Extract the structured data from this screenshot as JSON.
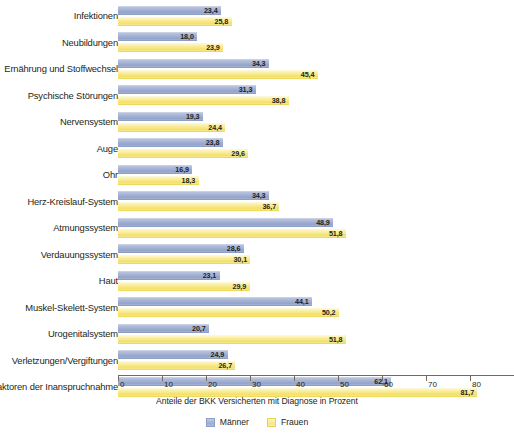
{
  "chart_data": {
    "type": "bar",
    "orientation": "horizontal",
    "title": "",
    "xlabel": "Anteile der BKK Versicherten mit Diagnose in Prozent",
    "ylabel": "",
    "xlim": [
      0,
      90
    ],
    "xticks": [
      0,
      10,
      20,
      30,
      40,
      50,
      60,
      70,
      80,
      90
    ],
    "grid": false,
    "legend_position": "bottom-center",
    "categories": [
      "Infektionen",
      "Neubildungen",
      "Ernährung und Stoffwechsel",
      "Psychische Störungen",
      "Nervensystem",
      "Auge",
      "Ohr",
      "Herz-Kreislauf-System",
      "Atmungssystem",
      "Verdauungssystem",
      "Haut",
      "Muskel-Skelett-System",
      "Urogenitalsystem",
      "Verletzungen/Vergiftungen",
      "Faktoren der Inanspruchnahme"
    ],
    "series": [
      {
        "name": "Männer",
        "color": "#a3b0d3",
        "values": [
          23.4,
          18.0,
          34.3,
          31.3,
          19.3,
          23.8,
          16.9,
          34.3,
          48.9,
          28.6,
          23.1,
          44.1,
          20.7,
          24.9,
          62.1
        ],
        "labels": [
          "23,4",
          "18,0",
          "34,3",
          "31,3",
          "19,3",
          "23,8",
          "16,9",
          "34,3",
          "48,9",
          "28,6",
          "23,1",
          "44,1",
          "20,7",
          "24,9",
          "62,1"
        ]
      },
      {
        "name": "Frauen",
        "color": "#f7e88c",
        "values": [
          25.8,
          23.9,
          45.4,
          38.8,
          24.4,
          29.6,
          18.3,
          36.7,
          51.8,
          30.1,
          29.9,
          50.2,
          51.8,
          26.7,
          81.7
        ],
        "labels": [
          "25,8",
          "23,9",
          "45,4",
          "38,8",
          "24,4",
          "29,6",
          "18,3",
          "36,7",
          "51,8",
          "30,1",
          "29,9",
          "50,2",
          "51,8",
          "26,7",
          "81,7"
        ]
      }
    ]
  },
  "legend": {
    "items": [
      {
        "label": "Männer"
      },
      {
        "label": "Frauen"
      }
    ]
  },
  "axis": {
    "caption": "Anteile der BKK Versicherten mit Diagnose in Prozent",
    "tick_labels": [
      "0",
      "10",
      "20",
      "30",
      "40",
      "50",
      "60",
      "70",
      "80",
      "90"
    ]
  },
  "top_strip": {
    "clipped_text": ""
  }
}
